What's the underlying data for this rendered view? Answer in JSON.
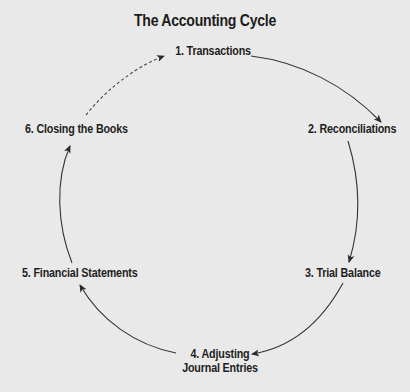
{
  "diagram": {
    "title": "The Accounting Cycle",
    "background_color": "#e9e9e9",
    "line_color": "#333333",
    "nodes": [
      {
        "id": 1,
        "label": "1. Transactions"
      },
      {
        "id": 2,
        "label": "2. Reconciliations"
      },
      {
        "id": 3,
        "label": "3. Trial Balance"
      },
      {
        "id": 4,
        "label_line1": "4. Adjusting",
        "label_line2": "Journal Entries"
      },
      {
        "id": 5,
        "label": "5. Financial Statements"
      },
      {
        "id": 6,
        "label": "6. Closing the Books"
      }
    ],
    "edges": [
      {
        "from": 1,
        "to": 2,
        "style": "solid",
        "icon": "arrow-icon"
      },
      {
        "from": 2,
        "to": 3,
        "style": "solid",
        "icon": "arrow-icon"
      },
      {
        "from": 3,
        "to": 4,
        "style": "solid",
        "icon": "arrow-icon"
      },
      {
        "from": 4,
        "to": 5,
        "style": "solid",
        "icon": "arrow-icon"
      },
      {
        "from": 5,
        "to": 6,
        "style": "solid",
        "icon": "arrow-icon"
      },
      {
        "from": 6,
        "to": 1,
        "style": "dashed",
        "icon": "dashed-arrow-icon"
      }
    ]
  }
}
